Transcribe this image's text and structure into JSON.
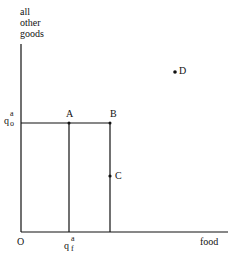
{
  "diagram": {
    "y_axis_label": [
      "all",
      "other",
      "goods"
    ],
    "x_axis_label": "food",
    "origin_label": "O",
    "q_o": {
      "base": "q",
      "sup": "a",
      "sub": "o"
    },
    "q_f": {
      "base": "q",
      "sup": "a",
      "sub": "f"
    },
    "points": [
      {
        "label": "A",
        "x": 69,
        "y": 123
      },
      {
        "label": "B",
        "x": 110,
        "y": 123
      },
      {
        "label": "C",
        "x": 110,
        "y": 176
      },
      {
        "label": "D",
        "x": 175,
        "y": 72
      }
    ]
  }
}
